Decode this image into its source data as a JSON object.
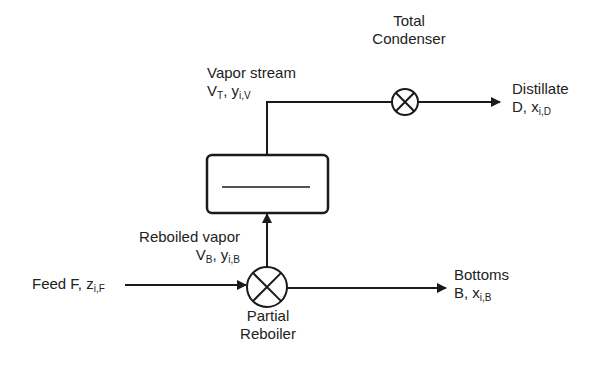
{
  "diagram": {
    "colors": {
      "stroke": "#1a1a1a",
      "text": "#222222",
      "background": "#ffffff"
    },
    "nodes": {
      "condenser": {
        "name": "Total Condenser",
        "line1": "Total",
        "line2": "Condenser"
      },
      "reboiler": {
        "name": "Partial Reboiler",
        "line1": "Partial",
        "line2": "Reboiler"
      },
      "column": {
        "name": "Column / stage box"
      }
    },
    "streams": {
      "vapor": {
        "label": "Vapor stream",
        "flow": "V",
        "flow_sub": "T",
        "comp": "y",
        "comp_sub": "i,V"
      },
      "distillate": {
        "label": "Distillate",
        "flow": "D",
        "comp": "x",
        "comp_sub": "i,D"
      },
      "reboiled": {
        "label": "Reboiled vapor",
        "flow": "V",
        "flow_sub": "B",
        "comp": "y",
        "comp_sub": "i,B"
      },
      "feed": {
        "label": "Feed F,",
        "comp": "z",
        "comp_sub": "i,F"
      },
      "bottoms": {
        "label": "Bottoms",
        "flow": "B",
        "comp": "x",
        "comp_sub": "i,B"
      }
    },
    "separator": ", "
  }
}
